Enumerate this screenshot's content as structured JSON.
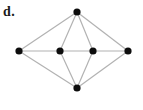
{
  "figure": {
    "label": "d.",
    "type": "graph-diagram",
    "background_color": "#ffffff",
    "label_color": "#1a1a1a"
  },
  "graph": {
    "node_color": "#0d0d0d",
    "node_radius": 3.6,
    "edge_color": "#b2b2b2",
    "edge_width": 1.2,
    "nodes": [
      {
        "id": "top",
        "x": 77,
        "y": 12
      },
      {
        "id": "left",
        "x": 19,
        "y": 51
      },
      {
        "id": "mid-left",
        "x": 60,
        "y": 51
      },
      {
        "id": "mid-right",
        "x": 93,
        "y": 51
      },
      {
        "id": "right",
        "x": 128,
        "y": 51
      },
      {
        "id": "bottom",
        "x": 77,
        "y": 88
      }
    ],
    "edges": [
      [
        "top",
        "left"
      ],
      [
        "top",
        "mid-left"
      ],
      [
        "top",
        "mid-right"
      ],
      [
        "top",
        "right"
      ],
      [
        "left",
        "mid-left"
      ],
      [
        "mid-left",
        "mid-right"
      ],
      [
        "mid-right",
        "right"
      ],
      [
        "left",
        "bottom"
      ],
      [
        "mid-left",
        "bottom"
      ],
      [
        "mid-right",
        "bottom"
      ],
      [
        "right",
        "bottom"
      ]
    ]
  }
}
